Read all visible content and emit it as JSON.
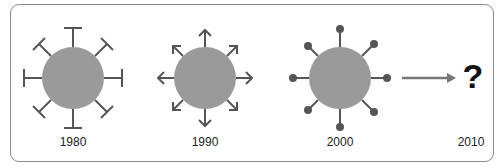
{
  "diagram": {
    "stages": [
      {
        "label": "1980",
        "spike_style": "t-bar"
      },
      {
        "label": "1990",
        "spike_style": "arrow"
      },
      {
        "label": "2000",
        "spike_style": "ball"
      },
      {
        "label": "2010",
        "spike_style": "unknown"
      }
    ],
    "unknown_symbol": "?",
    "colors": {
      "body": "#9a9a9a",
      "spike": "#555555",
      "frame": "#8a8a8a"
    }
  }
}
